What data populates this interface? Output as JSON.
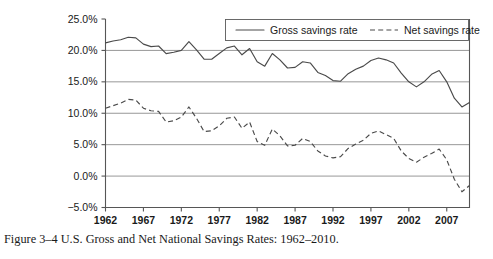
{
  "caption": "Figure 3–4  U.S. Gross and Net National Savings Rates: 1962–2010.",
  "legend": {
    "gross_label": "Gross savings rate",
    "net_label": "Net savings rate"
  },
  "axis": {
    "y_ticks": [
      "25.0%",
      "20.0%",
      "15.0%",
      "10.0%",
      "5.0%",
      "0.0%",
      "−5.0%"
    ],
    "x_ticks": [
      "1962",
      "1967",
      "1972",
      "1977",
      "1982",
      "1987",
      "1992",
      "1997",
      "2002",
      "2007"
    ]
  },
  "chart_data": {
    "type": "line",
    "title": "U.S. Gross and Net National Savings Rates: 1962–2010",
    "xlabel": "",
    "ylabel": "",
    "xlim": [
      1962,
      2010
    ],
    "ylim": [
      -5,
      25
    ],
    "ytick_values": [
      25,
      20,
      15,
      10,
      5,
      0,
      -5
    ],
    "xtick_values": [
      1962,
      1967,
      1972,
      1977,
      1982,
      1987,
      1992,
      1997,
      2002,
      2007
    ],
    "grid": "horizontal",
    "legend_position": "top-right",
    "x": [
      1962,
      1963,
      1964,
      1965,
      1966,
      1967,
      1968,
      1969,
      1970,
      1971,
      1972,
      1973,
      1974,
      1975,
      1976,
      1977,
      1978,
      1979,
      1980,
      1981,
      1982,
      1983,
      1984,
      1985,
      1986,
      1987,
      1988,
      1989,
      1990,
      1991,
      1992,
      1993,
      1994,
      1995,
      1996,
      1997,
      1998,
      1999,
      2000,
      2001,
      2002,
      2003,
      2004,
      2005,
      2006,
      2007,
      2008,
      2009,
      2010
    ],
    "series": [
      {
        "name": "Gross savings rate",
        "style": "solid",
        "color": "#4a4a4a",
        "values": [
          21.2,
          21.5,
          21.7,
          22.1,
          22.0,
          21.0,
          20.6,
          20.7,
          19.5,
          19.7,
          20.0,
          21.4,
          20.1,
          18.6,
          18.6,
          19.5,
          20.4,
          20.7,
          19.3,
          20.3,
          18.2,
          17.5,
          19.5,
          18.5,
          17.2,
          17.3,
          18.2,
          18.0,
          16.5,
          16.0,
          15.2,
          15.1,
          16.3,
          17.0,
          17.5,
          18.4,
          18.8,
          18.5,
          18.0,
          16.4,
          15.0,
          14.2,
          15.0,
          16.2,
          16.8,
          15.0,
          12.4,
          11.0,
          11.7
        ]
      },
      {
        "name": "Net savings rate",
        "style": "dashed",
        "color": "#4a4a4a",
        "values": [
          10.8,
          11.2,
          11.6,
          12.2,
          12.1,
          10.8,
          10.4,
          10.3,
          8.6,
          8.8,
          9.4,
          11.0,
          9.2,
          7.1,
          7.2,
          8.0,
          9.2,
          9.4,
          7.6,
          8.6,
          5.5,
          4.9,
          7.5,
          6.4,
          4.8,
          4.9,
          6.0,
          5.5,
          4.0,
          3.2,
          2.9,
          3.1,
          4.4,
          5.1,
          5.7,
          6.8,
          7.2,
          6.6,
          6.0,
          4.0,
          2.8,
          2.2,
          3.0,
          3.6,
          4.3,
          2.6,
          -0.5,
          -2.5,
          -1.5
        ]
      }
    ]
  }
}
